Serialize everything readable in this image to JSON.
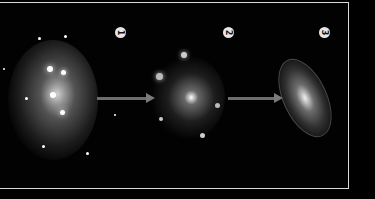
{
  "diagram": {
    "stages": [
      {
        "number": "1",
        "label": "stage-1-protogalactic-cloud"
      },
      {
        "number": "2",
        "label": "stage-2-clumpy-protogalaxy"
      },
      {
        "number": "3",
        "label": "stage-3-spiral-galaxy"
      }
    ],
    "arrows": 2,
    "colors": {
      "background": "#000000",
      "frame": "#d8d8d8",
      "arrow": "#6e6e6e",
      "badge": "#e6e6e6"
    }
  }
}
